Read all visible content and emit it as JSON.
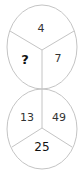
{
  "puzzle": {
    "top_circle": {
      "top": "4",
      "left": "?",
      "right": "7"
    },
    "bottom_circle": {
      "left": "13",
      "right": "49",
      "bottom": "25"
    }
  },
  "colors": {
    "stroke": "#bdbdbd",
    "text": "#333333"
  }
}
